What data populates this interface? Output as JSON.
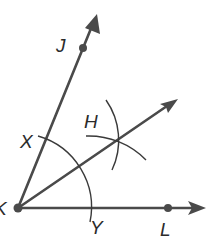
{
  "diagram": {
    "vertex": {
      "label": "K",
      "x": 18,
      "y": 208
    },
    "points": [
      {
        "label": "J",
        "x": 83,
        "y": 48,
        "label_x": 56,
        "label_y": 52
      },
      {
        "label": "L",
        "x": 168,
        "y": 208,
        "label_x": 160,
        "label_y": 236
      },
      {
        "label": "X",
        "x": 44,
        "y": 140,
        "label_x": 20,
        "label_y": 148
      },
      {
        "label": "Y",
        "x": 90,
        "y": 208,
        "label_x": 90,
        "label_y": 234
      },
      {
        "label": "H",
        "x": 117,
        "y": 140,
        "label_x": 84,
        "label_y": 128
      }
    ],
    "rays": [
      {
        "name": "ray-KJ",
        "from": "K",
        "through": "J"
      },
      {
        "name": "ray-KL",
        "from": "K",
        "through": "L"
      },
      {
        "name": "ray-KH",
        "from": "K",
        "through": "H"
      }
    ],
    "arcs": [
      {
        "name": "arc-centered-K",
        "center": "K",
        "through": [
          "X",
          "Y"
        ]
      },
      {
        "name": "arc-centered-X",
        "center": "X",
        "through": [
          "H"
        ]
      },
      {
        "name": "arc-centered-Y",
        "center": "Y",
        "through": [
          "H"
        ]
      }
    ],
    "colors": {
      "stroke": "#4a4a4a",
      "text": "#2b2b2b",
      "background": "#ffffff"
    }
  }
}
